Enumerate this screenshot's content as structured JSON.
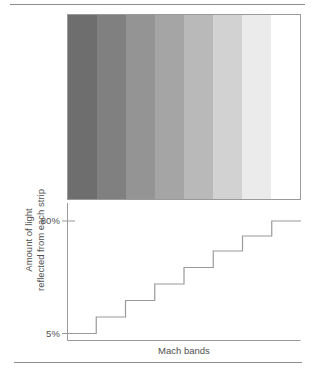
{
  "figure": {
    "rules": {
      "top_label": "top-divider",
      "bottom_label": "bottom-divider"
    }
  },
  "bands": {
    "label": "mach-bands-strip",
    "count": 8,
    "colors": [
      "#6e6e6e",
      "#808080",
      "#949494",
      "#a5a5a5",
      "#b9b9b9",
      "#d2d2d2",
      "#ebebeb",
      "#ffffff"
    ]
  },
  "axis": {
    "y_title_line1": "Amount of light",
    "y_title_line2": "reflected from each strip",
    "y_tick_high": "80%",
    "y_tick_low": "5%",
    "x_title": "Mach bands"
  },
  "chart_data": {
    "type": "bar",
    "title": "Mach bands",
    "subtitle": "",
    "xlabel": "Mach bands",
    "ylabel": "Amount of light reflected from each strip",
    "categories": [
      "1",
      "2",
      "3",
      "4",
      "5",
      "6",
      "7",
      "8"
    ],
    "values": [
      5,
      16,
      27,
      38,
      49,
      60,
      70,
      80
    ],
    "tick_labels": [
      "5%",
      "80%"
    ],
    "ylim": [
      0,
      92
    ],
    "xlim": [
      0,
      8
    ],
    "grid": false,
    "legend": null,
    "step_style": "staircase",
    "strip_colors": [
      "#6e6e6e",
      "#808080",
      "#949494",
      "#a5a5a5",
      "#b9b9b9",
      "#d2d2d2",
      "#ebebeb",
      "#ffffff"
    ]
  }
}
